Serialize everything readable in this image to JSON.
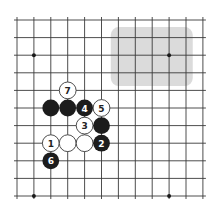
{
  "board": {
    "view": {
      "columns": 12,
      "rows": 11,
      "origin_x": 17,
      "origin_y": 20,
      "spacing_x": 16.9,
      "spacing_y": 17.6,
      "overhang": 3
    },
    "colors": {
      "background": "#ffffff",
      "line": "#3a3a3a",
      "black_stone": "#1c1c1c",
      "white_stone": "#ffffff",
      "highlight": "#cfcfcf"
    },
    "star_points": [
      {
        "col": 1,
        "row": 2
      },
      {
        "col": 9,
        "row": 2
      },
      {
        "col": 1,
        "row": 10
      },
      {
        "col": 9,
        "row": 10
      }
    ],
    "highlight_region": {
      "col_from": 5.55,
      "col_to": 10.4,
      "row_from": 0.4,
      "row_to": 3.75,
      "corner_radius": 8
    },
    "stones": [
      {
        "color": "white",
        "col": 3,
        "row": 4,
        "label": "7"
      },
      {
        "color": "black",
        "col": 2,
        "row": 5,
        "label": ""
      },
      {
        "color": "black",
        "col": 3,
        "row": 5,
        "label": ""
      },
      {
        "color": "black",
        "col": 4,
        "row": 5,
        "label": "4"
      },
      {
        "color": "white",
        "col": 5,
        "row": 5,
        "label": "5"
      },
      {
        "color": "white",
        "col": 4,
        "row": 6,
        "label": "3"
      },
      {
        "color": "black",
        "col": 5,
        "row": 6,
        "label": ""
      },
      {
        "color": "white",
        "col": 2,
        "row": 7,
        "label": "1"
      },
      {
        "color": "white",
        "col": 3,
        "row": 7,
        "label": ""
      },
      {
        "color": "white",
        "col": 4,
        "row": 7,
        "label": ""
      },
      {
        "color": "black",
        "col": 5,
        "row": 7,
        "label": "2"
      },
      {
        "color": "black",
        "col": 2,
        "row": 8,
        "label": "6"
      }
    ]
  }
}
